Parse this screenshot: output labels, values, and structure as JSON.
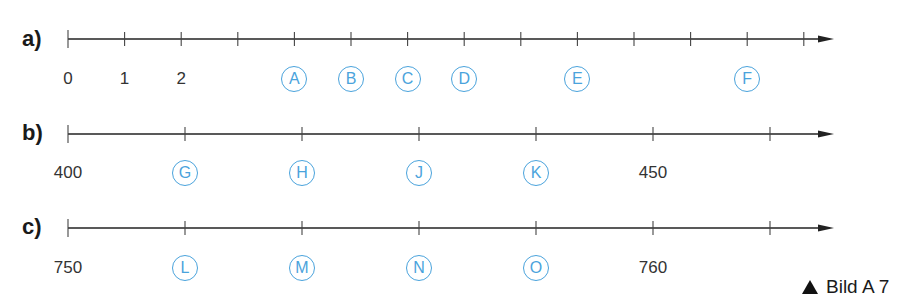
{
  "figure": {
    "caption": "Bild A 7",
    "colors": {
      "line": "#222222",
      "marker": "#4aa3dc",
      "text": "#333333"
    }
  },
  "lines": [
    {
      "id": "a",
      "label": "a)",
      "y": 39,
      "label_y": 79,
      "ticks_x": [
        68,
        124.6,
        181.2,
        237.8,
        294.4,
        351,
        407.6,
        464.2,
        520.8,
        577.4,
        634,
        690.6,
        747.2,
        803.8
      ],
      "numbers": [
        {
          "text": "0",
          "x": 68
        },
        {
          "text": "1",
          "x": 124.6
        },
        {
          "text": "2",
          "x": 181.2
        }
      ],
      "markers": [
        {
          "letter": "A",
          "x": 294.4,
          "value": 4
        },
        {
          "letter": "B",
          "x": 351,
          "value": 5
        },
        {
          "letter": "C",
          "x": 407.6,
          "value": 6
        },
        {
          "letter": "D",
          "x": 464.2,
          "value": 7
        },
        {
          "letter": "E",
          "x": 577.4,
          "value": 9
        },
        {
          "letter": "F",
          "x": 747.2,
          "value": 12
        }
      ]
    },
    {
      "id": "b",
      "label": "b)",
      "y": 134,
      "label_y": 173,
      "ticks_x": [
        68,
        185,
        302,
        419,
        536,
        653,
        770
      ],
      "numbers": [
        {
          "text": "400",
          "x": 68
        },
        {
          "text": "450",
          "x": 653
        }
      ],
      "markers": [
        {
          "letter": "G",
          "x": 185,
          "value": 410
        },
        {
          "letter": "H",
          "x": 302,
          "value": 420
        },
        {
          "letter": "J",
          "x": 419,
          "value": 430
        },
        {
          "letter": "K",
          "x": 536,
          "value": 440
        }
      ]
    },
    {
      "id": "c",
      "label": "c)",
      "y": 228,
      "label_y": 268,
      "ticks_x": [
        68,
        185,
        302,
        419,
        536,
        653,
        770
      ],
      "numbers": [
        {
          "text": "750",
          "x": 68
        },
        {
          "text": "760",
          "x": 653
        }
      ],
      "markers": [
        {
          "letter": "L",
          "x": 185,
          "value": 752
        },
        {
          "letter": "M",
          "x": 302,
          "value": 754
        },
        {
          "letter": "N",
          "x": 419,
          "value": 756
        },
        {
          "letter": "O",
          "x": 536,
          "value": 758
        }
      ]
    }
  ]
}
